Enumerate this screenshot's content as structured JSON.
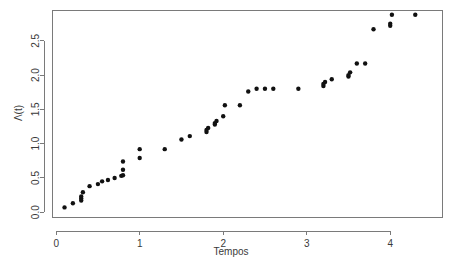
{
  "chart_data": {
    "type": "scatter",
    "title": "",
    "xlabel": "Tempos",
    "ylabel": "Λ(t)",
    "xlim": [
      -0.05,
      4.62
    ],
    "ylim": [
      -0.07,
      2.95
    ],
    "xticks": [
      0,
      1,
      2,
      3,
      4
    ],
    "xticklabels": [
      "0",
      "1",
      "2",
      "3",
      "4"
    ],
    "yticks": [
      0.0,
      0.5,
      1.0,
      1.5,
      2.0,
      2.5
    ],
    "yticklabels": [
      "0.0",
      "0.5",
      "1.0",
      "1.5",
      "2.0",
      "2.5"
    ],
    "grid": false,
    "legend": null,
    "point_color": "#111111",
    "point_radius": 2.2,
    "frame": true,
    "series": [
      {
        "name": "Lambda(t)",
        "x": [
          0.1,
          0.2,
          0.3,
          0.3,
          0.3,
          0.32,
          0.4,
          0.5,
          0.55,
          0.62,
          0.7,
          0.78,
          0.8,
          0.8,
          0.8,
          1.0,
          1.0,
          1.3,
          1.5,
          1.6,
          1.8,
          1.8,
          1.82,
          1.9,
          1.9,
          1.92,
          2.0,
          2.02,
          2.2,
          2.3,
          2.4,
          2.5,
          2.6,
          2.9,
          3.2,
          3.2,
          3.22,
          3.3,
          3.5,
          3.5,
          3.52,
          3.6,
          3.7,
          3.8,
          4.0,
          4.0,
          4.02,
          4.3
        ],
        "y": [
          0.07,
          0.13,
          0.17,
          0.2,
          0.23,
          0.29,
          0.38,
          0.41,
          0.45,
          0.47,
          0.5,
          0.53,
          0.54,
          0.62,
          0.74,
          0.79,
          0.92,
          0.92,
          1.06,
          1.11,
          1.17,
          1.2,
          1.23,
          1.28,
          1.3,
          1.33,
          1.4,
          1.56,
          1.56,
          1.76,
          1.8,
          1.8,
          1.8,
          1.8,
          1.84,
          1.87,
          1.9,
          1.94,
          1.98,
          2.0,
          2.04,
          2.17,
          2.17,
          2.67,
          2.72,
          2.75,
          2.88,
          2.88
        ]
      }
    ]
  },
  "axes": {
    "x_title": "Tempos",
    "y_title": "Λ(t)"
  }
}
